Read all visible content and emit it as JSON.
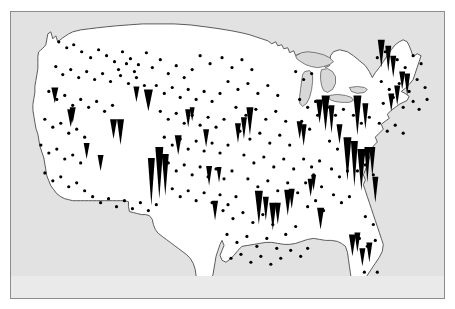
{
  "figure": {
    "title": "",
    "caption": "",
    "background_color": "#ffffff",
    "panel_color": "#e2e2e2",
    "panel_border_color": "#8c8c8c",
    "land_fill": "#ffffff",
    "land_stroke": "#4a4a4a",
    "lake_fill": "#d8d8d8",
    "marker_color": "#000000"
  },
  "chart_data": {
    "type": "scatter",
    "title": "",
    "subtitle": "",
    "xlabel": "",
    "ylabel": "",
    "projection_note": "Conterminous United States, conic projection with curved northern border",
    "grid": false,
    "legend": "none",
    "axis_ticks": [],
    "units": "map pixels in 435 x 288 panel space",
    "marker_types": [
      {
        "name": "spike",
        "shape": "downward-pointing triangle anchored at location, height proportional to magnitude",
        "color": "#000000"
      },
      {
        "name": "dot",
        "shape": "small filled circle, fixed size, denotes location with negligible magnitude",
        "color": "#000000"
      }
    ],
    "xlim": [
      0,
      435
    ],
    "ylim": [
      0,
      288
    ],
    "spikes": [
      {
        "x": 141,
        "y": 195,
        "w": 7,
        "h": 48
      },
      {
        "x": 149,
        "y": 188,
        "w": 8,
        "h": 52
      },
      {
        "x": 155,
        "y": 185,
        "w": 7,
        "h": 42
      },
      {
        "x": 138,
        "y": 100,
        "w": 9,
        "h": 22
      },
      {
        "x": 310,
        "y": 112,
        "w": 7,
        "h": 24
      },
      {
        "x": 316,
        "y": 120,
        "w": 8,
        "h": 36
      },
      {
        "x": 322,
        "y": 122,
        "w": 6,
        "h": 28
      },
      {
        "x": 330,
        "y": 133,
        "w": 6,
        "h": 20
      },
      {
        "x": 348,
        "y": 124,
        "w": 8,
        "h": 40
      },
      {
        "x": 356,
        "y": 118,
        "w": 6,
        "h": 26
      },
      {
        "x": 228,
        "y": 132,
        "w": 6,
        "h": 20
      },
      {
        "x": 234,
        "y": 128,
        "w": 6,
        "h": 22
      },
      {
        "x": 240,
        "y": 124,
        "w": 7,
        "h": 28
      },
      {
        "x": 249,
        "y": 214,
        "w": 8,
        "h": 34
      },
      {
        "x": 256,
        "y": 210,
        "w": 6,
        "h": 24
      },
      {
        "x": 263,
        "y": 220,
        "w": 7,
        "h": 28
      },
      {
        "x": 268,
        "y": 214,
        "w": 6,
        "h": 22
      },
      {
        "x": 278,
        "y": 205,
        "w": 7,
        "h": 26
      },
      {
        "x": 282,
        "y": 198,
        "w": 6,
        "h": 20
      },
      {
        "x": 301,
        "y": 186,
        "w": 6,
        "h": 18
      },
      {
        "x": 304,
        "y": 180,
        "w": 5,
        "h": 16
      },
      {
        "x": 338,
        "y": 170,
        "w": 8,
        "h": 44
      },
      {
        "x": 345,
        "y": 176,
        "w": 7,
        "h": 46
      },
      {
        "x": 352,
        "y": 180,
        "w": 8,
        "h": 42
      },
      {
        "x": 358,
        "y": 172,
        "w": 6,
        "h": 36
      },
      {
        "x": 363,
        "y": 166,
        "w": 6,
        "h": 30
      },
      {
        "x": 366,
        "y": 192,
        "w": 6,
        "h": 26
      },
      {
        "x": 311,
        "y": 219,
        "w": 7,
        "h": 22
      },
      {
        "x": 343,
        "y": 246,
        "w": 7,
        "h": 22
      },
      {
        "x": 348,
        "y": 242,
        "w": 6,
        "h": 20
      },
      {
        "x": 353,
        "y": 256,
        "w": 6,
        "h": 18
      },
      {
        "x": 360,
        "y": 252,
        "w": 6,
        "h": 20
      },
      {
        "x": 60,
        "y": 116,
        "w": 7,
        "h": 18
      },
      {
        "x": 62,
        "y": 112,
        "w": 6,
        "h": 16
      },
      {
        "x": 44,
        "y": 92,
        "w": 7,
        "h": 16
      },
      {
        "x": 76,
        "y": 148,
        "w": 6,
        "h": 16
      },
      {
        "x": 103,
        "y": 128,
        "w": 7,
        "h": 20
      },
      {
        "x": 110,
        "y": 134,
        "w": 7,
        "h": 26
      },
      {
        "x": 168,
        "y": 144,
        "w": 7,
        "h": 20
      },
      {
        "x": 196,
        "y": 136,
        "w": 6,
        "h": 18
      },
      {
        "x": 199,
        "y": 175,
        "w": 6,
        "h": 20
      },
      {
        "x": 209,
        "y": 172,
        "w": 5,
        "h": 16
      },
      {
        "x": 205,
        "y": 210,
        "w": 6,
        "h": 20
      },
      {
        "x": 126,
        "y": 91,
        "w": 6,
        "h": 16
      },
      {
        "x": 178,
        "y": 116,
        "w": 6,
        "h": 18
      },
      {
        "x": 182,
        "y": 110,
        "w": 5,
        "h": 14
      },
      {
        "x": 90,
        "y": 160,
        "w": 6,
        "h": 16
      },
      {
        "x": 294,
        "y": 135,
        "w": 6,
        "h": 22
      },
      {
        "x": 290,
        "y": 128,
        "w": 6,
        "h": 18
      },
      {
        "x": 372,
        "y": 56,
        "w": 7,
        "h": 28
      },
      {
        "x": 379,
        "y": 60,
        "w": 6,
        "h": 26
      },
      {
        "x": 384,
        "y": 66,
        "w": 6,
        "h": 22
      },
      {
        "x": 393,
        "y": 78,
        "w": 6,
        "h": 18
      },
      {
        "x": 398,
        "y": 84,
        "w": 6,
        "h": 22
      },
      {
        "x": 388,
        "y": 94,
        "w": 6,
        "h": 20
      },
      {
        "x": 382,
        "y": 100,
        "w": 6,
        "h": 18
      }
    ],
    "dots": [
      {
        "x": 48,
        "y": 30
      },
      {
        "x": 56,
        "y": 36
      },
      {
        "x": 63,
        "y": 33
      },
      {
        "x": 71,
        "y": 40
      },
      {
        "x": 80,
        "y": 46
      },
      {
        "x": 88,
        "y": 38
      },
      {
        "x": 96,
        "y": 44
      },
      {
        "x": 104,
        "y": 50
      },
      {
        "x": 112,
        "y": 40
      },
      {
        "x": 120,
        "y": 47
      },
      {
        "x": 128,
        "y": 53
      },
      {
        "x": 136,
        "y": 41
      },
      {
        "x": 45,
        "y": 55
      },
      {
        "x": 52,
        "y": 63
      },
      {
        "x": 60,
        "y": 58
      },
      {
        "x": 68,
        "y": 66
      },
      {
        "x": 76,
        "y": 60
      },
      {
        "x": 84,
        "y": 68
      },
      {
        "x": 92,
        "y": 62
      },
      {
        "x": 100,
        "y": 70
      },
      {
        "x": 110,
        "y": 64
      },
      {
        "x": 118,
        "y": 72
      },
      {
        "x": 126,
        "y": 66
      },
      {
        "x": 134,
        "y": 74
      },
      {
        "x": 38,
        "y": 80
      },
      {
        "x": 46,
        "y": 88
      },
      {
        "x": 54,
        "y": 84
      },
      {
        "x": 62,
        "y": 94
      },
      {
        "x": 70,
        "y": 88
      },
      {
        "x": 78,
        "y": 96
      },
      {
        "x": 86,
        "y": 90
      },
      {
        "x": 94,
        "y": 100
      },
      {
        "x": 102,
        "y": 94
      },
      {
        "x": 34,
        "y": 108
      },
      {
        "x": 42,
        "y": 116
      },
      {
        "x": 50,
        "y": 112
      },
      {
        "x": 58,
        "y": 122
      },
      {
        "x": 66,
        "y": 118
      },
      {
        "x": 74,
        "y": 126
      },
      {
        "x": 30,
        "y": 134
      },
      {
        "x": 38,
        "y": 142
      },
      {
        "x": 46,
        "y": 138
      },
      {
        "x": 54,
        "y": 148
      },
      {
        "x": 62,
        "y": 144
      },
      {
        "x": 70,
        "y": 152
      },
      {
        "x": 34,
        "y": 162
      },
      {
        "x": 42,
        "y": 170
      },
      {
        "x": 50,
        "y": 166
      },
      {
        "x": 58,
        "y": 176
      },
      {
        "x": 66,
        "y": 172
      },
      {
        "x": 74,
        "y": 180
      },
      {
        "x": 82,
        "y": 186
      },
      {
        "x": 90,
        "y": 192
      },
      {
        "x": 98,
        "y": 188
      },
      {
        "x": 106,
        "y": 196
      },
      {
        "x": 114,
        "y": 190
      },
      {
        "x": 122,
        "y": 198
      },
      {
        "x": 130,
        "y": 192
      },
      {
        "x": 138,
        "y": 200
      },
      {
        "x": 146,
        "y": 194
      },
      {
        "x": 108,
        "y": 58
      },
      {
        "x": 116,
        "y": 52
      },
      {
        "x": 124,
        "y": 60
      },
      {
        "x": 142,
        "y": 56
      },
      {
        "x": 150,
        "y": 48
      },
      {
        "x": 158,
        "y": 62
      },
      {
        "x": 166,
        "y": 54
      },
      {
        "x": 174,
        "y": 66
      },
      {
        "x": 182,
        "y": 58
      },
      {
        "x": 146,
        "y": 74
      },
      {
        "x": 154,
        "y": 82
      },
      {
        "x": 162,
        "y": 76
      },
      {
        "x": 170,
        "y": 86
      },
      {
        "x": 178,
        "y": 78
      },
      {
        "x": 186,
        "y": 88
      },
      {
        "x": 194,
        "y": 80
      },
      {
        "x": 202,
        "y": 90
      },
      {
        "x": 210,
        "y": 82
      },
      {
        "x": 150,
        "y": 100
      },
      {
        "x": 158,
        "y": 108
      },
      {
        "x": 166,
        "y": 102
      },
      {
        "x": 174,
        "y": 112
      },
      {
        "x": 182,
        "y": 104
      },
      {
        "x": 190,
        "y": 114
      },
      {
        "x": 198,
        "y": 106
      },
      {
        "x": 206,
        "y": 116
      },
      {
        "x": 214,
        "y": 108
      },
      {
        "x": 154,
        "y": 126
      },
      {
        "x": 162,
        "y": 134
      },
      {
        "x": 170,
        "y": 128
      },
      {
        "x": 178,
        "y": 138
      },
      {
        "x": 186,
        "y": 130
      },
      {
        "x": 194,
        "y": 140
      },
      {
        "x": 202,
        "y": 132
      },
      {
        "x": 210,
        "y": 142
      },
      {
        "x": 218,
        "y": 134
      },
      {
        "x": 158,
        "y": 152
      },
      {
        "x": 166,
        "y": 160
      },
      {
        "x": 174,
        "y": 154
      },
      {
        "x": 182,
        "y": 164
      },
      {
        "x": 190,
        "y": 156
      },
      {
        "x": 198,
        "y": 166
      },
      {
        "x": 206,
        "y": 158
      },
      {
        "x": 214,
        "y": 168
      },
      {
        "x": 222,
        "y": 160
      },
      {
        "x": 162,
        "y": 178
      },
      {
        "x": 170,
        "y": 186
      },
      {
        "x": 178,
        "y": 180
      },
      {
        "x": 186,
        "y": 190
      },
      {
        "x": 194,
        "y": 182
      },
      {
        "x": 202,
        "y": 192
      },
      {
        "x": 210,
        "y": 184
      },
      {
        "x": 218,
        "y": 194
      },
      {
        "x": 226,
        "y": 186
      },
      {
        "x": 190,
        "y": 44
      },
      {
        "x": 200,
        "y": 52
      },
      {
        "x": 212,
        "y": 46
      },
      {
        "x": 222,
        "y": 56
      },
      {
        "x": 232,
        "y": 48
      },
      {
        "x": 242,
        "y": 58
      },
      {
        "x": 218,
        "y": 70
      },
      {
        "x": 228,
        "y": 78
      },
      {
        "x": 238,
        "y": 72
      },
      {
        "x": 248,
        "y": 82
      },
      {
        "x": 258,
        "y": 74
      },
      {
        "x": 268,
        "y": 84
      },
      {
        "x": 226,
        "y": 96
      },
      {
        "x": 236,
        "y": 104
      },
      {
        "x": 246,
        "y": 98
      },
      {
        "x": 256,
        "y": 108
      },
      {
        "x": 266,
        "y": 100
      },
      {
        "x": 276,
        "y": 110
      },
      {
        "x": 230,
        "y": 120
      },
      {
        "x": 240,
        "y": 128
      },
      {
        "x": 250,
        "y": 122
      },
      {
        "x": 260,
        "y": 132
      },
      {
        "x": 270,
        "y": 124
      },
      {
        "x": 280,
        "y": 134
      },
      {
        "x": 234,
        "y": 144
      },
      {
        "x": 244,
        "y": 152
      },
      {
        "x": 254,
        "y": 146
      },
      {
        "x": 264,
        "y": 156
      },
      {
        "x": 274,
        "y": 148
      },
      {
        "x": 284,
        "y": 158
      },
      {
        "x": 238,
        "y": 168
      },
      {
        "x": 248,
        "y": 176
      },
      {
        "x": 258,
        "y": 170
      },
      {
        "x": 268,
        "y": 180
      },
      {
        "x": 278,
        "y": 172
      },
      {
        "x": 288,
        "y": 182
      },
      {
        "x": 213,
        "y": 200
      },
      {
        "x": 223,
        "y": 208
      },
      {
        "x": 233,
        "y": 202
      },
      {
        "x": 243,
        "y": 212
      },
      {
        "x": 253,
        "y": 204
      },
      {
        "x": 263,
        "y": 214
      },
      {
        "x": 217,
        "y": 224
      },
      {
        "x": 227,
        "y": 232
      },
      {
        "x": 237,
        "y": 226
      },
      {
        "x": 247,
        "y": 236
      },
      {
        "x": 257,
        "y": 228
      },
      {
        "x": 267,
        "y": 238
      },
      {
        "x": 221,
        "y": 248
      },
      {
        "x": 231,
        "y": 244
      },
      {
        "x": 241,
        "y": 252
      },
      {
        "x": 251,
        "y": 246
      },
      {
        "x": 261,
        "y": 254
      },
      {
        "x": 271,
        "y": 248
      },
      {
        "x": 281,
        "y": 240
      },
      {
        "x": 291,
        "y": 246
      },
      {
        "x": 298,
        "y": 238
      },
      {
        "x": 286,
        "y": 60
      },
      {
        "x": 294,
        "y": 68
      },
      {
        "x": 302,
        "y": 62
      },
      {
        "x": 290,
        "y": 88
      },
      {
        "x": 298,
        "y": 96
      },
      {
        "x": 306,
        "y": 90
      },
      {
        "x": 292,
        "y": 110
      },
      {
        "x": 300,
        "y": 118
      },
      {
        "x": 308,
        "y": 104
      },
      {
        "x": 294,
        "y": 148
      },
      {
        "x": 302,
        "y": 156
      },
      {
        "x": 310,
        "y": 150
      },
      {
        "x": 296,
        "y": 172
      },
      {
        "x": 304,
        "y": 164
      },
      {
        "x": 312,
        "y": 176
      },
      {
        "x": 298,
        "y": 196
      },
      {
        "x": 306,
        "y": 190
      },
      {
        "x": 314,
        "y": 200
      },
      {
        "x": 318,
        "y": 96
      },
      {
        "x": 326,
        "y": 104
      },
      {
        "x": 334,
        "y": 98
      },
      {
        "x": 320,
        "y": 130
      },
      {
        "x": 328,
        "y": 138
      },
      {
        "x": 336,
        "y": 132
      },
      {
        "x": 322,
        "y": 158
      },
      {
        "x": 330,
        "y": 166
      },
      {
        "x": 338,
        "y": 160
      },
      {
        "x": 324,
        "y": 184
      },
      {
        "x": 332,
        "y": 192
      },
      {
        "x": 340,
        "y": 186
      },
      {
        "x": 344,
        "y": 104
      },
      {
        "x": 352,
        "y": 112
      },
      {
        "x": 360,
        "y": 106
      },
      {
        "x": 346,
        "y": 136
      },
      {
        "x": 354,
        "y": 144
      },
      {
        "x": 362,
        "y": 138
      },
      {
        "x": 348,
        "y": 160
      },
      {
        "x": 356,
        "y": 154
      },
      {
        "x": 364,
        "y": 164
      },
      {
        "x": 368,
        "y": 46
      },
      {
        "x": 376,
        "y": 40
      },
      {
        "x": 388,
        "y": 48
      },
      {
        "x": 396,
        "y": 56
      },
      {
        "x": 404,
        "y": 44
      },
      {
        "x": 412,
        "y": 52
      },
      {
        "x": 372,
        "y": 70
      },
      {
        "x": 380,
        "y": 78
      },
      {
        "x": 390,
        "y": 72
      },
      {
        "x": 400,
        "y": 80
      },
      {
        "x": 408,
        "y": 68
      },
      {
        "x": 416,
        "y": 76
      },
      {
        "x": 374,
        "y": 92
      },
      {
        "x": 384,
        "y": 86
      },
      {
        "x": 394,
        "y": 96
      },
      {
        "x": 404,
        "y": 90
      },
      {
        "x": 410,
        "y": 98
      },
      {
        "x": 418,
        "y": 88
      },
      {
        "x": 370,
        "y": 112
      },
      {
        "x": 378,
        "y": 120
      },
      {
        "x": 386,
        "y": 114
      },
      {
        "x": 394,
        "y": 122
      },
      {
        "x": 356,
        "y": 206
      },
      {
        "x": 364,
        "y": 214
      },
      {
        "x": 350,
        "y": 228
      },
      {
        "x": 358,
        "y": 236
      },
      {
        "x": 366,
        "y": 230
      },
      {
        "x": 355,
        "y": 262
      },
      {
        "x": 362,
        "y": 270
      },
      {
        "x": 358,
        "y": 278
      },
      {
        "x": 368,
        "y": 262
      },
      {
        "x": 286,
        "y": 216
      },
      {
        "x": 276,
        "y": 224
      }
    ]
  },
  "accessibility": {
    "figure_description": "Black-and-white thematic map of the conterminous United States. Small black dots mark locations across the country; downward-pointing black spikes of varying height mark locations with larger associated magnitude, concentrated along the Northeast corridor, the Atlantic Southeast coast, southern California, the Great Lakes and the Gulf coast."
  }
}
